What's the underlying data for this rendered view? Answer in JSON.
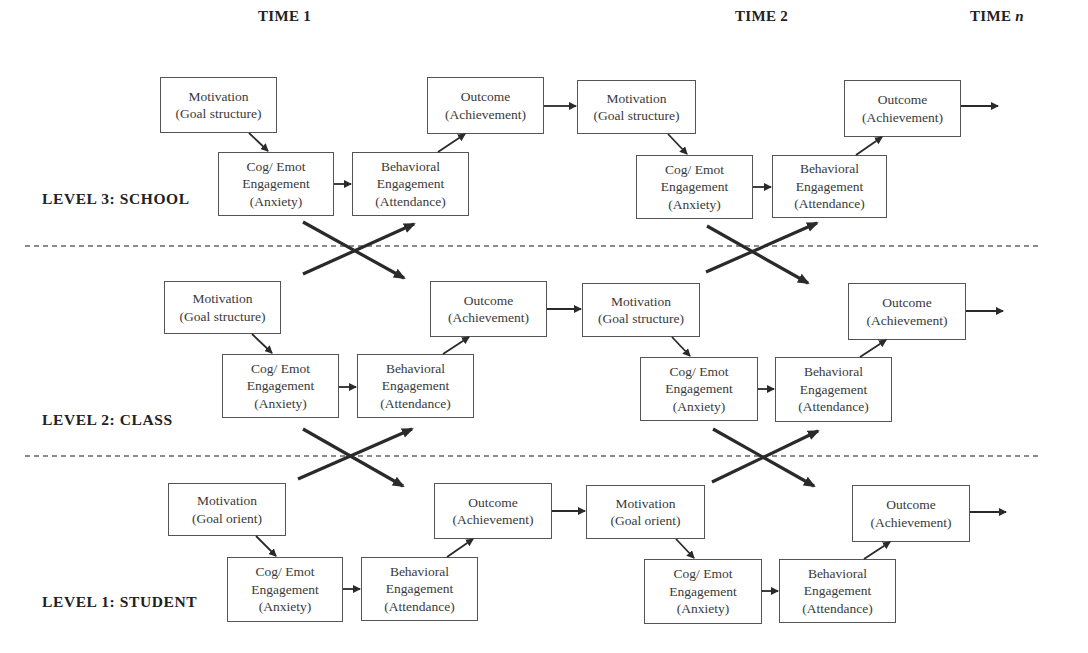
{
  "headers": {
    "time1": "TIME 1",
    "time2": "TIME 2",
    "timen_prefix": "TIME ",
    "timen_italic": "n"
  },
  "levels": [
    {
      "label": "LEVEL 3: SCHOOL",
      "time1": {
        "motivation": [
          "Motivation",
          "(Goal structure)"
        ],
        "cog": [
          "Cog/ Emot",
          "Engagement",
          "(Anxiety)"
        ],
        "behavioral": [
          "Behavioral",
          "Engagement",
          "(Attendance)"
        ],
        "outcome": [
          "Outcome",
          "(Achievement)"
        ]
      },
      "time2": {
        "motivation": [
          "Motivation",
          "(Goal structure)"
        ],
        "cog": [
          "Cog/ Emot",
          "Engagement",
          "(Anxiety)"
        ],
        "behavioral": [
          "Behavioral",
          "Engagement",
          "(Attendance)"
        ],
        "outcome": [
          "Outcome",
          "(Achievement)"
        ]
      }
    },
    {
      "label": "LEVEL 2: CLASS",
      "time1": {
        "motivation": [
          "Motivation",
          "(Goal structure)"
        ],
        "cog": [
          "Cog/ Emot",
          "Engagement",
          "(Anxiety)"
        ],
        "behavioral": [
          "Behavioral",
          "Engagement",
          "(Attendance)"
        ],
        "outcome": [
          "Outcome",
          "(Achievement)"
        ]
      },
      "time2": {
        "motivation": [
          "Motivation",
          "(Goal structure)"
        ],
        "cog": [
          "Cog/ Emot",
          "Engagement",
          "(Anxiety)"
        ],
        "behavioral": [
          "Behavioral",
          "Engagement",
          "(Attendance)"
        ],
        "outcome": [
          "Outcome",
          "(Achievement)"
        ]
      }
    },
    {
      "label": "LEVEL 1: STUDENT",
      "time1": {
        "motivation": [
          "Motivation",
          "(Goal orient)"
        ],
        "cog": [
          "Cog/ Emot",
          "Engagement",
          "(Anxiety)"
        ],
        "behavioral": [
          "Behavioral",
          "Engagement",
          "(Attendance)"
        ],
        "outcome": [
          "Outcome",
          "(Achievement)"
        ]
      },
      "time2": {
        "motivation": [
          "Motivation",
          "(Goal orient)"
        ],
        "cog": [
          "Cog/ Emot",
          "Engagement",
          "(Anxiety)"
        ],
        "behavioral": [
          "Behavioral",
          "Engagement",
          "(Attendance)"
        ],
        "outcome": [
          "Outcome",
          "(Achievement)"
        ]
      }
    }
  ],
  "colors": {
    "line": "#2a2a2a",
    "box_border": "#555555",
    "dashed": "#666666"
  }
}
